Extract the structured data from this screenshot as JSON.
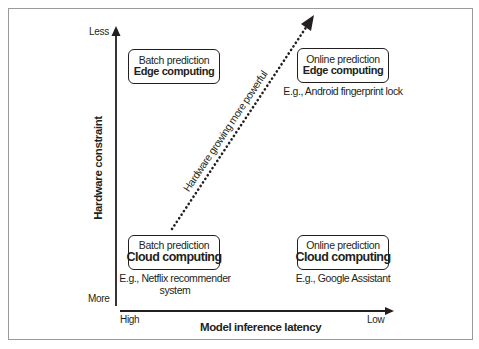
{
  "diagram": {
    "type": "quadrant",
    "colors": {
      "ink": "#231f20",
      "frame_border": "#9a9a9a",
      "background": "#ffffff"
    },
    "axes": {
      "y": {
        "title": "Hardware constraint",
        "top_label": "Less",
        "bottom_label": "More"
      },
      "x": {
        "title": "Model inference latency",
        "left_label": "High",
        "right_label": "Low"
      }
    },
    "trend_arrow": {
      "label": "Hardware growing more powerful",
      "style": "dotted",
      "direction": "bottom-left to top-right"
    },
    "quadrants": {
      "top_left": {
        "line1": "Batch prediction",
        "line2": "Edge computing",
        "example": ""
      },
      "top_right": {
        "line1": "Online prediction",
        "line2": "Edge computing",
        "example": "E.g., Android fingerprint lock"
      },
      "bottom_left": {
        "line1": "Batch prediction",
        "line2": "Cloud computing",
        "example": "E.g., Netflix recommender system"
      },
      "bottom_right": {
        "line1": "Online prediction",
        "line2": "Cloud computing",
        "example": "E.g., Google Assistant"
      }
    }
  }
}
